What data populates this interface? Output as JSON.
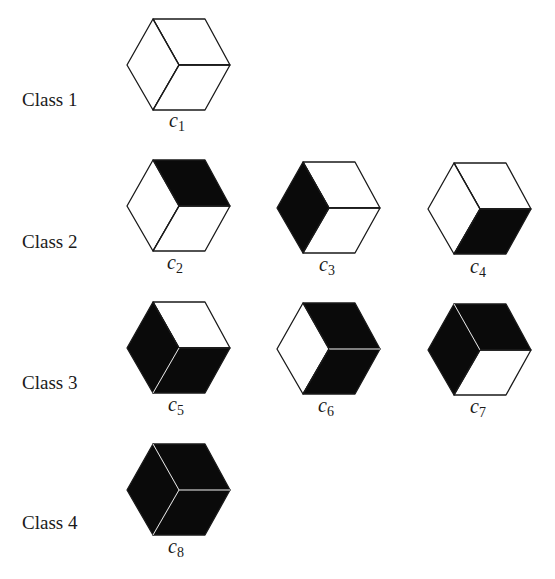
{
  "figure": {
    "classes": [
      {
        "label": "Class 1",
        "cubes": [
          {
            "name": "c",
            "sub": "1",
            "faces": {
              "top": "white",
              "left": "white",
              "right": "white"
            }
          }
        ]
      },
      {
        "label": "Class 2",
        "cubes": [
          {
            "name": "c",
            "sub": "2",
            "faces": {
              "top": "black",
              "left": "white",
              "right": "white"
            }
          },
          {
            "name": "c",
            "sub": "3",
            "faces": {
              "top": "white",
              "left": "black",
              "right": "white"
            }
          },
          {
            "name": "c",
            "sub": "4",
            "faces": {
              "top": "white",
              "left": "white",
              "right": "black"
            }
          }
        ]
      },
      {
        "label": "Class 3",
        "cubes": [
          {
            "name": "c",
            "sub": "5",
            "faces": {
              "top": "white",
              "left": "black",
              "right": "black"
            }
          },
          {
            "name": "c",
            "sub": "6",
            "faces": {
              "top": "black",
              "left": "white",
              "right": "black"
            }
          },
          {
            "name": "c",
            "sub": "7",
            "faces": {
              "top": "black",
              "left": "black",
              "right": "white"
            }
          }
        ]
      },
      {
        "label": "Class 4",
        "cubes": [
          {
            "name": "c",
            "sub": "8",
            "faces": {
              "top": "black",
              "left": "black",
              "right": "black"
            }
          }
        ]
      }
    ],
    "colors": {
      "filled": "#0a0a0a",
      "empty": "#ffffff",
      "stroke": "#1a1a1a"
    }
  }
}
